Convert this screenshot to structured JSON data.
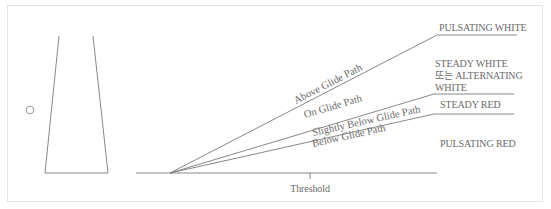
{
  "diagram": {
    "colors": {
      "line": "#7a7a7a",
      "text": "#6a6a6a",
      "frame": "#e2e2e2"
    },
    "paths": [
      {
        "id": "above",
        "label": "Above Glide Path",
        "signal": "PULSATING WHITE"
      },
      {
        "id": "on",
        "label": "On Glide Path",
        "signal_lines": [
          "STEADY WHITE",
          "또는 ALTERNATING",
          "WHITE"
        ]
      },
      {
        "id": "slightly-below",
        "label": "Slightly Below Glide Path",
        "signal": "STEADY RED"
      },
      {
        "id": "below",
        "label": "Below Glide Path",
        "signal": "PULSATING RED"
      }
    ],
    "threshold_label": "Threshold"
  }
}
